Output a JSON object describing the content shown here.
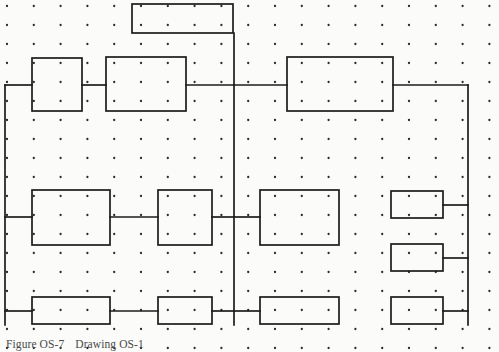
{
  "figure": {
    "canvas": {
      "width": 499,
      "height": 352,
      "background": "#fbfbf9"
    },
    "caption": {
      "label": "Figure OS-7",
      "title": "Drawing OS-1",
      "color": "#4a4a4a"
    },
    "grid": {
      "description": "dot grid",
      "dot_color": "#2b2b2b",
      "dot_radius": 1.15,
      "origin_x": 7,
      "origin_y": 6,
      "spacing_x": 26.8,
      "spacing_y": 19.0,
      "columns": 19,
      "rows": 19
    },
    "style": {
      "line_color": "#1c1c1c",
      "line_width": 1.7,
      "box_fill": "none"
    },
    "boxes": [
      {
        "name": "top-header-box",
        "x": 132,
        "y": 4,
        "w": 101,
        "h": 29
      },
      {
        "name": "row2-box-left",
        "x": 32,
        "y": 58,
        "w": 50,
        "h": 53
      },
      {
        "name": "row2-box-mid",
        "x": 106,
        "y": 57,
        "w": 80,
        "h": 54
      },
      {
        "name": "row2-box-right",
        "x": 287,
        "y": 57,
        "w": 106,
        "h": 54
      },
      {
        "name": "row3-box-left",
        "x": 32,
        "y": 190,
        "w": 78,
        "h": 55
      },
      {
        "name": "row3-box-mid",
        "x": 158,
        "y": 190,
        "w": 54,
        "h": 55
      },
      {
        "name": "row3-box-right",
        "x": 260,
        "y": 190,
        "w": 79,
        "h": 55
      },
      {
        "name": "stack-box-top",
        "x": 391,
        "y": 191,
        "w": 52,
        "h": 27
      },
      {
        "name": "stack-box-middle",
        "x": 391,
        "y": 244,
        "w": 52,
        "h": 27
      },
      {
        "name": "stack-box-bottom",
        "x": 391,
        "y": 297,
        "w": 52,
        "h": 27
      },
      {
        "name": "row4-box-left",
        "x": 32,
        "y": 297,
        "w": 78,
        "h": 27
      },
      {
        "name": "row4-box-mid",
        "x": 158,
        "y": 297,
        "w": 54,
        "h": 27
      },
      {
        "name": "row4-box-right",
        "x": 260,
        "y": 297,
        "w": 79,
        "h": 27
      }
    ],
    "connectors": [
      {
        "name": "header-drop-to-center-bus",
        "points": "234,33 234,325"
      },
      {
        "name": "left-vertical-bus",
        "points": "5,85 5,325"
      },
      {
        "name": "right-vertical-bus",
        "points": "468,85 468,325"
      },
      {
        "name": "left-bus-to-row2-left-box",
        "points": "5,85 32,85"
      },
      {
        "name": "row2-left-to-row2-mid",
        "points": "82,85 106,85"
      },
      {
        "name": "row2-mid-to-center-bus",
        "points": "186,85 234,85"
      },
      {
        "name": "center-bus-to-row2-right",
        "points": "234,85 287,85"
      },
      {
        "name": "row2-right-to-right-bus",
        "points": "393,85 468,85"
      },
      {
        "name": "left-bus-to-row3-left-box",
        "points": "5,217 32,217"
      },
      {
        "name": "row3-left-to-row3-mid",
        "points": "110,217 158,217"
      },
      {
        "name": "row3-mid-to-center-bus",
        "points": "212,217 234,217"
      },
      {
        "name": "center-bus-to-row3-right",
        "points": "234,217 260,217"
      },
      {
        "name": "stack-top-to-right-bus",
        "points": "443,205 468,205"
      },
      {
        "name": "stack-middle-to-right-bus",
        "points": "443,258 468,258"
      },
      {
        "name": "stack-bottom-to-right-bus",
        "points": "443,311 468,311"
      },
      {
        "name": "left-bus-to-row4-left-box",
        "points": "5,311 32,311"
      },
      {
        "name": "row4-left-to-row4-mid",
        "points": "110,311 158,311"
      },
      {
        "name": "row4-mid-to-center-bus",
        "points": "212,311 234,311"
      },
      {
        "name": "center-bus-to-row4-right",
        "points": "234,311 260,311"
      }
    ]
  }
}
